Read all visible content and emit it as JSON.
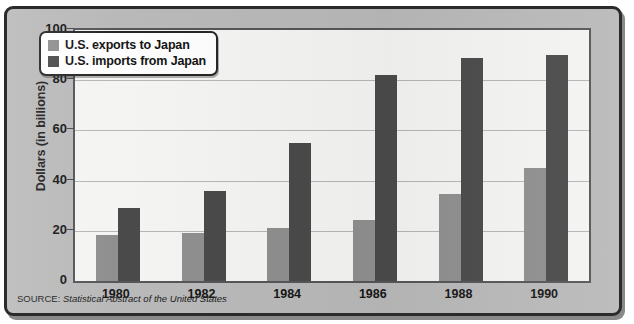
{
  "figure": {
    "y_axis_title": "Dollars (in billions)",
    "source_prefix": "SOURCE:",
    "source_title": "Statistical Abstract of the United States",
    "colors": {
      "exports": "#8f8f8f",
      "imports": "#4a4a4a",
      "plot_background": "#f4f4f2",
      "figure_background": "#b9b9b9",
      "frame": "#2b2b2b",
      "gridline": "#b6b6b6"
    }
  },
  "legend": {
    "position": "top-left-inside-plot",
    "entries": [
      {
        "label": "U.S. exports to Japan",
        "swatch": "exports"
      },
      {
        "label": "U.S. imports from Japan",
        "swatch": "imports"
      }
    ]
  },
  "chart_data": {
    "type": "bar",
    "title": "",
    "xlabel": "",
    "ylabel": "Dollars (in billions)",
    "ylim": [
      0,
      100
    ],
    "yticks": [
      0,
      20,
      40,
      60,
      80,
      100
    ],
    "ytick_labels": [
      "0",
      "20",
      "40",
      "60",
      "80",
      "100"
    ],
    "grid": true,
    "legend_position": "upper left",
    "categories": [
      "1980",
      "1982",
      "1984",
      "1986",
      "1988",
      "1990"
    ],
    "series": [
      {
        "name": "U.S. exports to Japan",
        "values": [
          18.5,
          19,
          21,
          24.5,
          34.5,
          45
        ]
      },
      {
        "name": "U.S. imports from Japan",
        "values": [
          29,
          36,
          55,
          82,
          89,
          90
        ]
      }
    ]
  }
}
